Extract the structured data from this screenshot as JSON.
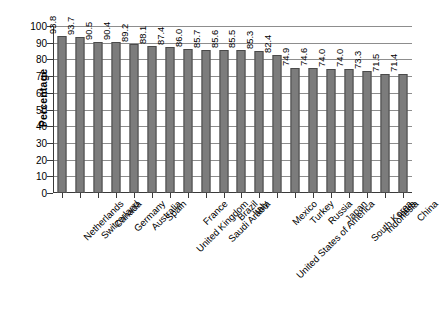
{
  "chart_data": {
    "type": "bar",
    "title": "",
    "subtitle": "",
    "xlabel": "",
    "ylabel": "Percentage",
    "ylim": [
      0,
      100
    ],
    "ytick_step": 10,
    "yticks": [
      0,
      10,
      20,
      30,
      40,
      50,
      60,
      70,
      80,
      90,
      100
    ],
    "grid": true,
    "legend": null,
    "legend_position": "none",
    "value_labels_rotated": true,
    "orientation": "vertical",
    "bar_color": "#7c7c7c",
    "bar_edge_color": "#4a4a4a",
    "axis_color": "#3a3a3a",
    "grid_color": "#8d8d8d",
    "background": "#ffffff",
    "categories": [
      "Netherlands",
      "Switzerland",
      "Canada",
      "Germany",
      "Australia",
      "Spain",
      "United Kingdom",
      "France",
      "Saudi Arabia",
      "Brazil",
      "Italy",
      "United States of America",
      "Mexico",
      "Turkey",
      "Russia",
      "Japan",
      "South Korea",
      "Indonesia",
      "India",
      "China"
    ],
    "values": [
      93.8,
      93.7,
      90.5,
      90.4,
      89.2,
      88.1,
      87.4,
      86.0,
      85.7,
      85.6,
      85.5,
      85.3,
      82.4,
      74.9,
      74.6,
      74.0,
      74.0,
      73.3,
      71.5,
      71.4
    ],
    "value_labels": [
      "93.8",
      "93.7",
      "90.5",
      "90.4",
      "89.2",
      "88.1",
      "87.4",
      "86.0",
      "85.7",
      "85.6",
      "85.5",
      "85.3",
      "82.4",
      "74.9",
      "74.6",
      "74.0",
      "74.0",
      "73.3",
      "71.5",
      "71.4"
    ]
  }
}
